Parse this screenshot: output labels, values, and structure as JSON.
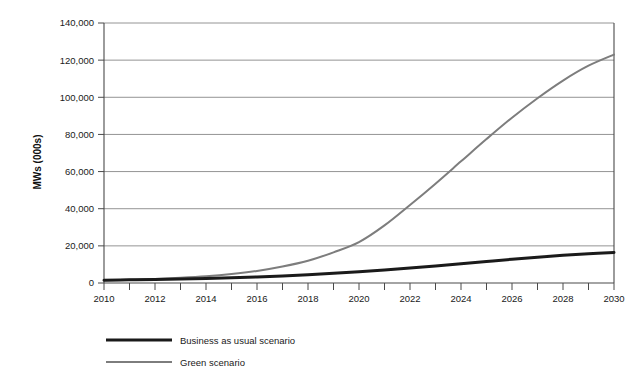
{
  "chart_data": {
    "type": "line",
    "title": "",
    "xlabel": "",
    "ylabel": "MWs (000s)",
    "xlim": [
      2010,
      2030
    ],
    "ylim": [
      0,
      140000
    ],
    "grid": true,
    "legend_position": "bottom-left",
    "x": [
      2010,
      2011,
      2012,
      2013,
      2014,
      2015,
      2016,
      2017,
      2018,
      2019,
      2020,
      2021,
      2022,
      2023,
      2024,
      2025,
      2026,
      2027,
      2028,
      2029,
      2030
    ],
    "xtick_labels": [
      "2010",
      "2012",
      "2014",
      "2016",
      "2018",
      "2020",
      "2022",
      "2024",
      "2026",
      "2028",
      "2030"
    ],
    "xticks": [
      2010,
      2012,
      2014,
      2016,
      2018,
      2020,
      2022,
      2024,
      2026,
      2028,
      2030
    ],
    "yticks": [
      0,
      20000,
      40000,
      60000,
      80000,
      100000,
      120000,
      140000
    ],
    "ytick_labels": [
      "0",
      "20,000",
      "40,000",
      "60,000",
      "80,000",
      "100,000",
      "120,000",
      "140,000"
    ],
    "series": [
      {
        "name": "Business as usual scenario",
        "color": "#1a1a1a",
        "width": 3.0,
        "values": [
          1500,
          1700,
          1900,
          2150,
          2450,
          2800,
          3250,
          3800,
          4450,
          5200,
          6050,
          7000,
          8050,
          9200,
          10400,
          11600,
          12800,
          13900,
          14900,
          15750,
          16400
        ]
      },
      {
        "name": "Green scenario",
        "color": "#7d7d7d",
        "width": 2.0,
        "values": [
          1500,
          1800,
          2200,
          2800,
          3600,
          4800,
          6500,
          8900,
          12000,
          16500,
          22000,
          31000,
          42000,
          53500,
          65500,
          77500,
          89000,
          99500,
          109000,
          117000,
          123000
        ]
      }
    ]
  },
  "legend": {
    "items": [
      {
        "label": "Business as usual scenario",
        "color": "#1a1a1a",
        "width": 3.0
      },
      {
        "label": "Green scenario",
        "color": "#7d7d7d",
        "width": 2.0
      }
    ]
  },
  "colors": {
    "background": "#ffffff",
    "axis": "#4a4a4a",
    "grid": "#888888",
    "text": "#1a1a1a"
  }
}
